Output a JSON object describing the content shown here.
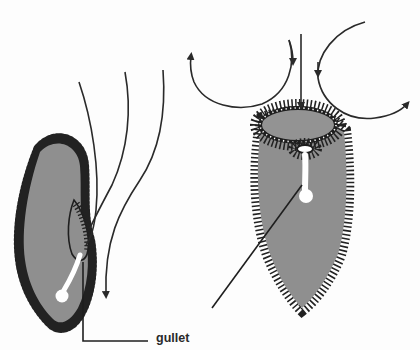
{
  "diagram": {
    "labels": {
      "gullet": "gullet"
    },
    "colors": {
      "body_fill": "#8f8f8f",
      "outline": "#1e1e1e",
      "cilia": "#222222",
      "vacuole": "#ffffff",
      "arrow": "#2a2a2a",
      "background": "#fdfdfd"
    },
    "elements": [
      {
        "id": "left-organism",
        "view": "side view, elongated body with oral groove"
      },
      {
        "id": "right-organism",
        "view": "front view, oval oral funnel at top"
      },
      {
        "id": "flow-arrows-left",
        "count": 3,
        "direction": "downward into oral groove"
      },
      {
        "id": "flow-arrows-right",
        "count": 3,
        "direction": "vortex currents around funnel"
      },
      {
        "id": "gullet-leader-lines",
        "count": 2
      }
    ]
  }
}
